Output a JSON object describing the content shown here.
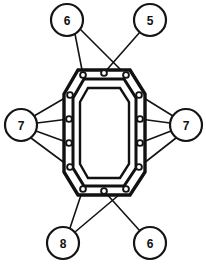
{
  "figure": {
    "type": "technical-parts-diagram",
    "title": "",
    "background_color": "#ffffff",
    "line_color": "#141414",
    "width": 206,
    "height": 265,
    "part": {
      "name": "gasket",
      "shape": "rounded-rectangle-octagonal",
      "description": "Flat gasket with double outline and fourteen bolt holes around its perimeter",
      "outer_outline": "M 64 94 L 78 70 L 130 70 L 145 94 L 145 172 L 130 195 L 78 195 L 64 172 Z",
      "inner_outline": "M 73 98 L 84 79 L 124 79 L 136 98 L 136 168 L 124 186 L 84 186 L 73 168 Z",
      "bore_outline": "M 80 102 L 88 88 L 120 88 L 129 102 L 129 164 L 120 178 L 88 178 L 80 164 Z",
      "bolt_hole_radius": 2.9,
      "bolt_holes": [
        {
          "id": "hole-1",
          "x": 83,
          "y": 75
        },
        {
          "id": "hole-2",
          "x": 104,
          "y": 73
        },
        {
          "id": "hole-3",
          "x": 126,
          "y": 75
        },
        {
          "id": "hole-4",
          "x": 70,
          "y": 95
        },
        {
          "id": "hole-5",
          "x": 139,
          "y": 95
        },
        {
          "id": "hole-6",
          "x": 69,
          "y": 119
        },
        {
          "id": "hole-7",
          "x": 140,
          "y": 119
        },
        {
          "id": "hole-8",
          "x": 69,
          "y": 143
        },
        {
          "id": "hole-9",
          "x": 140,
          "y": 143
        },
        {
          "id": "hole-10",
          "x": 70,
          "y": 167
        },
        {
          "id": "hole-11",
          "x": 139,
          "y": 167
        },
        {
          "id": "hole-12",
          "x": 83,
          "y": 189
        },
        {
          "id": "hole-13",
          "x": 104,
          "y": 191
        },
        {
          "id": "hole-14",
          "x": 126,
          "y": 189
        }
      ]
    },
    "callouts": [
      {
        "id": "callout-top-left",
        "label": "6",
        "cx": 67,
        "cy": 20,
        "r": 16,
        "leaders": [
          {
            "from_x": 75,
            "from_y": 34,
            "to_x": 83,
            "to_y": 75
          },
          {
            "from_x": 80,
            "from_y": 29,
            "to_x": 126,
            "to_y": 75
          }
        ]
      },
      {
        "id": "callout-top-right",
        "label": "5",
        "cx": 150,
        "cy": 20,
        "r": 16,
        "leaders": [
          {
            "from_x": 140,
            "from_y": 32,
            "to_x": 104,
            "to_y": 73
          }
        ]
      },
      {
        "id": "callout-left",
        "label": "7",
        "cx": 21,
        "cy": 125,
        "r": 16,
        "leaders": [
          {
            "from_x": 34,
            "from_y": 116,
            "to_x": 70,
            "to_y": 95
          },
          {
            "from_x": 37,
            "from_y": 123,
            "to_x": 69,
            "to_y": 119
          },
          {
            "from_x": 36,
            "from_y": 131,
            "to_x": 69,
            "to_y": 143
          },
          {
            "from_x": 31,
            "from_y": 138,
            "to_x": 70,
            "to_y": 167
          }
        ]
      },
      {
        "id": "callout-right",
        "label": "7",
        "cx": 186,
        "cy": 125,
        "r": 16,
        "leaders": [
          {
            "from_x": 173,
            "from_y": 116,
            "to_x": 139,
            "to_y": 95
          },
          {
            "from_x": 170,
            "from_y": 123,
            "to_x": 140,
            "to_y": 119
          },
          {
            "from_x": 171,
            "from_y": 131,
            "to_x": 140,
            "to_y": 143
          },
          {
            "from_x": 176,
            "from_y": 138,
            "to_x": 139,
            "to_y": 167
          }
        ]
      },
      {
        "id": "callout-bottom-left",
        "label": "8",
        "cx": 63,
        "cy": 243,
        "r": 16,
        "leaders": [
          {
            "from_x": 70,
            "from_y": 228,
            "to_x": 83,
            "to_y": 189
          },
          {
            "from_x": 75,
            "from_y": 232,
            "to_x": 126,
            "to_y": 189
          }
        ]
      },
      {
        "id": "callout-bottom-right",
        "label": "6",
        "cx": 150,
        "cy": 243,
        "r": 16,
        "leaders": [
          {
            "from_x": 140,
            "from_y": 231,
            "to_x": 104,
            "to_y": 191
          }
        ]
      }
    ]
  }
}
